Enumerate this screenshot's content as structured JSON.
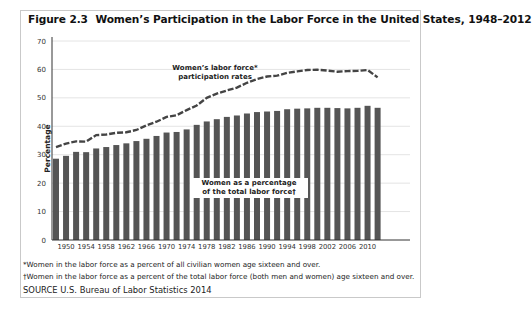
{
  "figure": {
    "number": "Figure 2.3",
    "title": "Women’s Participation in the Labor Force in the United States, 1948–2012"
  },
  "annotations": {
    "line_label_1": "Women’s labor force*",
    "line_label_2": "participation rates",
    "bar_label_1": "Women as a percentage",
    "bar_label_2": "of the total labor force†"
  },
  "footnotes": {
    "star": "*Women in the labor force as a percent of all civilian women age sixteen and over.",
    "dagger": "†Women in the labor force as a percent of the total labor force (both men and women) age sixteen and over.",
    "source": "SOURCE  U.S. Bureau of Labor Statistics 2014"
  },
  "colors": {
    "bar": "#555555",
    "line": "#444444",
    "grid": "#e4e4e4",
    "axis": "#333333"
  },
  "chart_data": {
    "type": "bar",
    "title": "Women’s Participation in the Labor Force in the United States, 1948–2012",
    "xlabel": "",
    "ylabel": "Percentage",
    "ylim": [
      0,
      70
    ],
    "yticks": [
      0,
      10,
      20,
      30,
      40,
      50,
      60,
      70
    ],
    "xtick_labels": [
      "1950",
      "1954",
      "1958",
      "1962",
      "1966",
      "1970",
      "1974",
      "1978",
      "1982",
      "1986",
      "1990",
      "1994",
      "1998",
      "2002",
      "2006",
      "2010"
    ],
    "grid": true,
    "legend": "inline annotations",
    "categories": [
      1948,
      1950,
      1952,
      1954,
      1956,
      1958,
      1960,
      1962,
      1964,
      1966,
      1968,
      1970,
      1972,
      1974,
      1976,
      1978,
      1980,
      1982,
      1984,
      1986,
      1988,
      1990,
      1992,
      1994,
      1996,
      1998,
      2000,
      2002,
      2004,
      2006,
      2008,
      2010,
      2012
    ],
    "series": [
      {
        "name": "Women as a percentage of the total labor force†",
        "type": "bar",
        "values": [
          28.6,
          29.6,
          31.0,
          30.9,
          32.2,
          32.7,
          33.4,
          34.0,
          34.8,
          35.6,
          36.6,
          37.8,
          38.0,
          38.9,
          40.5,
          41.7,
          42.5,
          43.3,
          43.8,
          44.5,
          45.0,
          45.2,
          45.4,
          46.0,
          46.2,
          46.3,
          46.5,
          46.5,
          46.4,
          46.3,
          46.5,
          47.2,
          46.5
        ]
      },
      {
        "name": "Women’s labor force* participation rates",
        "type": "line",
        "style": "dashed",
        "values": [
          32.7,
          33.9,
          34.7,
          34.6,
          36.9,
          37.1,
          37.7,
          37.9,
          38.7,
          40.3,
          41.6,
          43.3,
          43.9,
          45.7,
          47.3,
          50.0,
          51.5,
          52.6,
          53.6,
          55.3,
          56.6,
          57.5,
          57.8,
          58.8,
          59.3,
          59.8,
          59.9,
          59.6,
          59.2,
          59.4,
          59.5,
          59.8,
          57.2
        ]
      }
    ]
  }
}
